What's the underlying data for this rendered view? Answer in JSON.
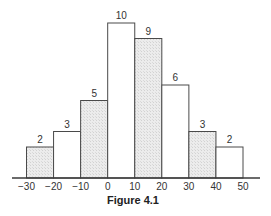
{
  "chart_data": {
    "type": "bar",
    "subtype": "histogram",
    "title": "",
    "caption": "Figure 4.1",
    "xlabel": "",
    "ylabel": "",
    "bin_edges": [
      -30,
      -20,
      -10,
      0,
      10,
      20,
      30,
      40,
      50
    ],
    "categories": [
      "-30 to -20",
      "-20 to -10",
      "-10 to 0",
      "0 to 10",
      "10 to 20",
      "20 to 30",
      "30 to 40",
      "40 to 50"
    ],
    "values": [
      2,
      3,
      5,
      10,
      9,
      6,
      3,
      2
    ],
    "shaded": [
      true,
      false,
      true,
      false,
      true,
      false,
      true,
      false
    ],
    "x_tick_labels": [
      "−30",
      "−20",
      "−10",
      "0",
      "10",
      "20",
      "30",
      "40",
      "50"
    ],
    "xlim": [
      -30,
      50
    ],
    "ylim": [
      0,
      10
    ],
    "grid": false,
    "legend": "none",
    "data_labels": [
      "2",
      "3",
      "5",
      "10",
      "9",
      "6",
      "3",
      "2"
    ]
  }
}
